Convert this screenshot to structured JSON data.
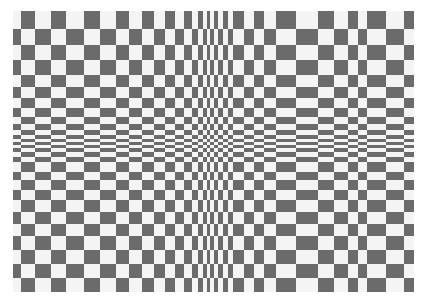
{
  "image": {
    "subject": "op-art checkerboard optical illusion",
    "colors": {
      "dark": "#6b6b6b",
      "light": "#f4f4f4",
      "background": "#ffffff"
    },
    "columns": [
      13,
      21,
      35,
      51,
      66,
      84,
      100,
      116,
      129,
      142,
      154,
      165,
      175,
      184,
      192,
      198,
      203,
      207,
      210,
      214,
      218,
      223,
      228,
      233,
      244,
      254,
      264,
      276,
      296,
      318,
      334,
      348,
      358,
      367,
      386,
      404,
      414
    ],
    "rows": [
      11,
      29,
      45,
      60,
      75,
      87,
      98,
      108,
      117,
      124,
      130,
      135,
      139,
      142,
      145,
      148,
      152,
      157,
      162,
      172,
      180,
      190,
      200,
      212,
      224,
      236,
      250,
      264,
      278,
      292
    ]
  }
}
